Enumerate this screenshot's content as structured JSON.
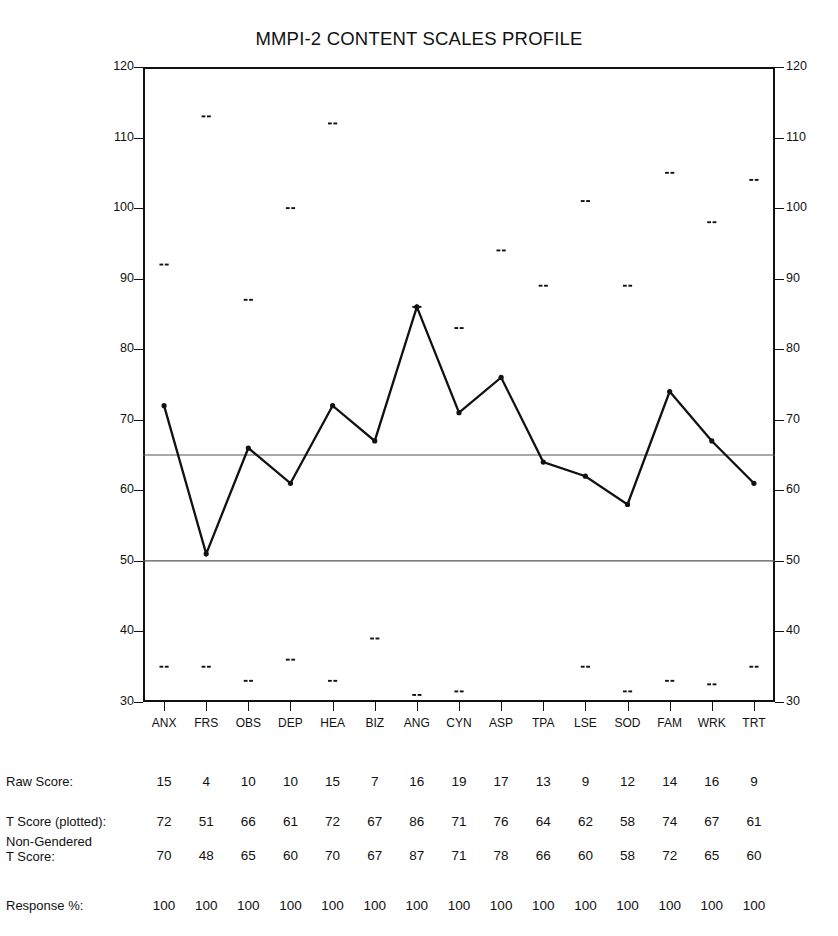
{
  "chart_data": {
    "type": "line",
    "title": "MMPI-2 CONTENT SCALES PROFILE",
    "xlabel": "",
    "ylabel": "",
    "ylim": [
      30,
      120
    ],
    "ytick_step": 10,
    "yticks": [
      30,
      40,
      50,
      60,
      70,
      80,
      90,
      100,
      110,
      120
    ],
    "grid": false,
    "legend": "none",
    "reference_lines": [
      65,
      50
    ],
    "categories": [
      "ANX",
      "FRS",
      "OBS",
      "DEP",
      "HEA",
      "BIZ",
      "ANG",
      "CYN",
      "ASP",
      "TPA",
      "LSE",
      "SOD",
      "FAM",
      "WRK",
      "TRT"
    ],
    "series": [
      {
        "name": "T Score (plotted)",
        "values": [
          72,
          51,
          66,
          61,
          72,
          67,
          86,
          71,
          76,
          64,
          62,
          58,
          74,
          67,
          61
        ]
      }
    ],
    "upper_marks": {
      "name": "upper confidence marks",
      "values": [
        92,
        113,
        87,
        100,
        112,
        120,
        86,
        83,
        94,
        89,
        101,
        89,
        105,
        98,
        104
      ]
    },
    "lower_marks": {
      "name": "lower confidence marks",
      "values": [
        35,
        35,
        33,
        36,
        33,
        39,
        31,
        31.5,
        30,
        30,
        35,
        31.5,
        33,
        32.5,
        35
      ]
    }
  },
  "axes": {
    "left_ticks": [
      "120",
      "110",
      "100",
      "90",
      "80",
      "70",
      "60",
      "50",
      "40",
      "30"
    ],
    "right_ticks": [
      "120",
      "110",
      "100",
      "90",
      "80",
      "70",
      "60",
      "50",
      "40",
      "30"
    ]
  },
  "table": {
    "rows": [
      {
        "label": "Raw Score:",
        "label_line2": "",
        "values": [
          "15",
          "4",
          "10",
          "10",
          "15",
          "7",
          "16",
          "19",
          "17",
          "13",
          "9",
          "12",
          "14",
          "16",
          "9"
        ]
      },
      {
        "label": "T Score (plotted):",
        "label_line2": "",
        "values": [
          "72",
          "51",
          "66",
          "61",
          "72",
          "67",
          "86",
          "71",
          "76",
          "64",
          "62",
          "58",
          "74",
          "67",
          "61"
        ]
      },
      {
        "label": "Non-Gendered",
        "label_line2": "T Score:",
        "values": [
          "70",
          "48",
          "65",
          "60",
          "70",
          "67",
          "87",
          "71",
          "78",
          "66",
          "60",
          "58",
          "72",
          "65",
          "60"
        ]
      },
      {
        "label": "Response %:",
        "label_line2": "",
        "values": [
          "100",
          "100",
          "100",
          "100",
          "100",
          "100",
          "100",
          "100",
          "100",
          "100",
          "100",
          "100",
          "100",
          "100",
          "100"
        ]
      }
    ]
  },
  "colors": {
    "line": "#111111",
    "frame": "#111111",
    "reference": "#555555",
    "background": "#ffffff"
  }
}
